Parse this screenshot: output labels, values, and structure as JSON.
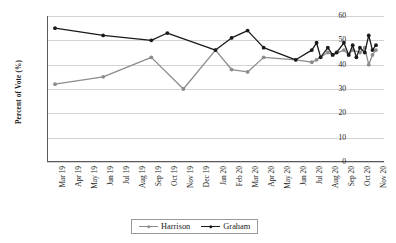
{
  "chart_data": {
    "type": "line",
    "title": "",
    "xlabel": "",
    "ylabel": "Percent of Vote (%)",
    "ylim": [
      0,
      60
    ],
    "ytick_values": [
      0,
      10,
      20,
      30,
      40,
      50,
      60
    ],
    "grid": true,
    "legend_position": "bottom-center",
    "x_tick_labels": [
      "Mar 19",
      "Apr 19",
      "May 19",
      "Jun 19",
      "Jul 19",
      "Aug 19",
      "Sep 19",
      "Oct 19",
      "Nov 19",
      "Dec 19",
      "Jan 20",
      "Feb 20",
      "Mar 20",
      "Apr 20",
      "May 20",
      "Jun 20",
      "Jul 20",
      "Aug 20",
      "Sep 20",
      "Oct 20",
      "Nov 20"
    ],
    "series": [
      {
        "name": "Harrison",
        "color": "#8c8c8c",
        "points": [
          {
            "x": "Mar 19",
            "y": 32
          },
          {
            "x": "Jun 19",
            "y": 35
          },
          {
            "x": "Sep 19",
            "y": 43
          },
          {
            "x": "Nov 19",
            "y": 30
          },
          {
            "x": "Jan 20",
            "y": 46
          },
          {
            "x": "Feb 20",
            "y": 38
          },
          {
            "x": "Mar 20",
            "y": 37
          },
          {
            "x": "Apr 20",
            "y": 43
          },
          {
            "x": "Jun 20",
            "y": 42
          },
          {
            "x": "Jul 20",
            "y": 41
          },
          {
            "x": "Jul 20 b",
            "y": 42
          },
          {
            "x": "Aug 20",
            "y": 45
          },
          {
            "x": "Aug 20 b",
            "y": 44
          },
          {
            "x": "Sep 20",
            "y": 46
          },
          {
            "x": "Sep 20 b",
            "y": 44
          },
          {
            "x": "Sep 20 c",
            "y": 46
          },
          {
            "x": "Oct 20",
            "y": 45
          },
          {
            "x": "Oct 20 b",
            "y": 47
          },
          {
            "x": "Oct 20 c",
            "y": 40
          },
          {
            "x": "Oct 20 d",
            "y": 44
          },
          {
            "x": "Nov 20",
            "y": 46
          }
        ]
      },
      {
        "name": "Graham",
        "color": "#1a1a1a",
        "points": [
          {
            "x": "Mar 19",
            "y": 55
          },
          {
            "x": "Jun 19",
            "y": 52
          },
          {
            "x": "Sep 19",
            "y": 50
          },
          {
            "x": "Oct 19",
            "y": 53
          },
          {
            "x": "Jan 20",
            "y": 46
          },
          {
            "x": "Feb 20",
            "y": 51
          },
          {
            "x": "Mar 20",
            "y": 54
          },
          {
            "x": "Apr 20",
            "y": 47
          },
          {
            "x": "Jun 20",
            "y": 42
          },
          {
            "x": "Jul 20",
            "y": 46
          },
          {
            "x": "Jul 20 b",
            "y": 49
          },
          {
            "x": "Jul 20 c",
            "y": 43
          },
          {
            "x": "Aug 20",
            "y": 47
          },
          {
            "x": "Aug 20 b",
            "y": 44
          },
          {
            "x": "Aug 20 c",
            "y": 45
          },
          {
            "x": "Sep 20",
            "y": 49
          },
          {
            "x": "Sep 20 b",
            "y": 44
          },
          {
            "x": "Sep 20 c",
            "y": 48
          },
          {
            "x": "Sep 20 d",
            "y": 43
          },
          {
            "x": "Oct 20",
            "y": 47
          },
          {
            "x": "Oct 20 b",
            "y": 45
          },
          {
            "x": "Oct 20 c",
            "y": 52
          },
          {
            "x": "Oct 20 d",
            "y": 46
          },
          {
            "x": "Nov 20",
            "y": 48
          }
        ]
      }
    ]
  },
  "legend": {
    "items": [
      {
        "label": "Harrison",
        "color": "#8c8c8c"
      },
      {
        "label": "Graham",
        "color": "#1a1a1a"
      }
    ]
  }
}
